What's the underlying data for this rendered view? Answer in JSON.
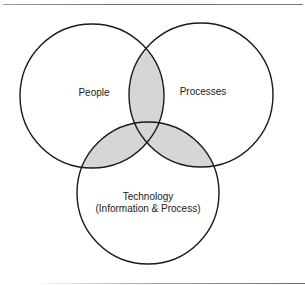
{
  "diagram": {
    "type": "venn",
    "colors": {
      "stroke": "#1a1a1a",
      "overlap_fill": "#d6d6d6",
      "background": "#ffffff"
    },
    "sets": [
      {
        "id": "people",
        "label": "People"
      },
      {
        "id": "processes",
        "label": "Processes"
      },
      {
        "id": "technology",
        "label_line1": "Technology",
        "label_line2": "(Information & Process)"
      }
    ],
    "shaded_regions": [
      "people∩processes",
      "people∩technology",
      "processes∩technology"
    ]
  }
}
